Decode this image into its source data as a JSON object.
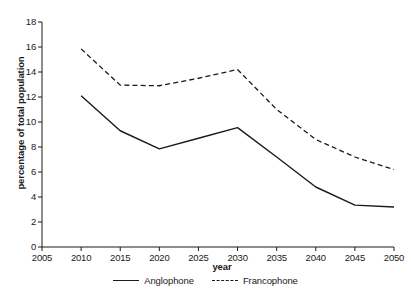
{
  "chart_data": {
    "type": "line",
    "title": "",
    "xlabel": "year",
    "ylabel": "percentage of total population",
    "x": [
      2005,
      2010,
      2015,
      2020,
      2025,
      2030,
      2035,
      2040,
      2045,
      2050
    ],
    "categories": [
      "2005",
      "2010",
      "2015",
      "2020",
      "2025",
      "2030",
      "2035",
      "2040",
      "2045",
      "2050"
    ],
    "xlim": [
      2005,
      2050
    ],
    "ylim": [
      0,
      18
    ],
    "ytick_labels": [
      "0",
      "2",
      "4",
      "6",
      "8",
      "10",
      "12",
      "14",
      "16",
      "18"
    ],
    "ytick_values": [
      0,
      2,
      4,
      6,
      8,
      10,
      12,
      14,
      16,
      18
    ],
    "grid": false,
    "legend_position": "bottom",
    "series": [
      {
        "name": "Anglophone",
        "style": "solid",
        "color": "#1a1a1a",
        "x": [
          2010,
          2015,
          2020,
          2025,
          2030,
          2035,
          2040,
          2045,
          2050
        ],
        "values": [
          12.1,
          9.3,
          7.85,
          8.7,
          9.55,
          7.2,
          4.8,
          3.35,
          3.2
        ]
      },
      {
        "name": "Francophone",
        "style": "dashed",
        "color": "#1a1a1a",
        "x": [
          2010,
          2015,
          2020,
          2025,
          2030,
          2035,
          2040,
          2045,
          2050
        ],
        "values": [
          15.85,
          12.95,
          12.9,
          13.5,
          14.2,
          11.0,
          8.6,
          7.2,
          6.2
        ]
      }
    ]
  },
  "axes": {
    "x_title": "year",
    "y_title": "percentage of total population"
  },
  "legend": {
    "entries": [
      {
        "label": "Anglophone",
        "style": "solid"
      },
      {
        "label": "Francophone",
        "style": "dashed"
      }
    ]
  }
}
